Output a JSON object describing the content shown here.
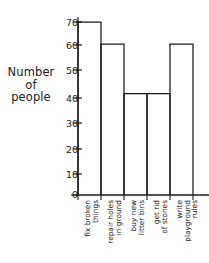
{
  "chart_data": {
    "type": "bar",
    "title": "",
    "xlabel": "",
    "ylabel": "Number of people",
    "ylim": [
      0,
      75
    ],
    "yticks": [
      0,
      10,
      20,
      30,
      40,
      50,
      60,
      70
    ],
    "grid": false,
    "legend": null,
    "categories": [
      "fix broken things",
      "repair holes in ground",
      "buy new litter bins",
      "get rid of stones",
      "write playground rules"
    ],
    "values": [
      70,
      61,
      41,
      41,
      61
    ]
  },
  "axes": {
    "y_label_lines": [
      "Number",
      "of",
      "people"
    ],
    "tick_labels": [
      "70",
      "60",
      "50",
      "40",
      "30",
      "20",
      "10",
      "0"
    ]
  },
  "x_labels": [
    {
      "lines": [
        "fix broken",
        "things"
      ]
    },
    {
      "lines": [
        "repair holes",
        "in ground"
      ]
    },
    {
      "lines": [
        "buy new",
        "litter bins"
      ]
    },
    {
      "lines": [
        "get rid",
        "of stones"
      ]
    },
    {
      "lines": [
        "write",
        "playground",
        "rules"
      ]
    }
  ],
  "colors": {
    "ink": "#1a1a1a",
    "background": "#ffffff"
  }
}
